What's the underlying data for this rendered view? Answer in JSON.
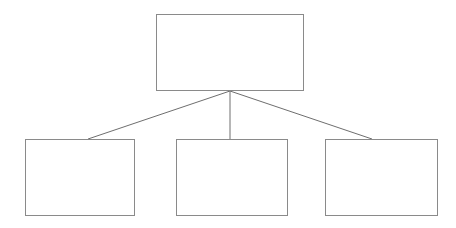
{
  "diagram": {
    "type": "hierarchy-tree",
    "canvas": {
      "width": 456,
      "height": 228,
      "background_color": "#ffffff"
    },
    "style": {
      "box_fill_color": "#ffffff",
      "box_border_color": "#8a8a8a",
      "box_border_width": 1,
      "connector_color": "#6e6e6e",
      "connector_width": 1
    },
    "nodes": [
      {
        "id": "root",
        "role": "parent",
        "label": "",
        "x": 156,
        "y": 14,
        "width": 148,
        "height": 77
      },
      {
        "id": "child-1",
        "role": "child",
        "label": "",
        "x": 25,
        "y": 139,
        "width": 110,
        "height": 77
      },
      {
        "id": "child-2",
        "role": "child",
        "label": "",
        "x": 176,
        "y": 139,
        "width": 112,
        "height": 77
      },
      {
        "id": "child-3",
        "role": "child",
        "label": "",
        "x": 325,
        "y": 139,
        "width": 113,
        "height": 77
      }
    ],
    "connectors": [
      {
        "id": "root-to-child-1",
        "from": "root",
        "to": "child-1",
        "x1": 230,
        "y1": 91,
        "x2": 88,
        "y2": 139
      },
      {
        "id": "root-to-child-2",
        "from": "root",
        "to": "child-2",
        "x1": 230,
        "y1": 91,
        "x2": 230,
        "y2": 139
      },
      {
        "id": "root-to-child-3",
        "from": "root",
        "to": "child-3",
        "x1": 230,
        "y1": 91,
        "x2": 372,
        "y2": 139
      }
    ]
  }
}
